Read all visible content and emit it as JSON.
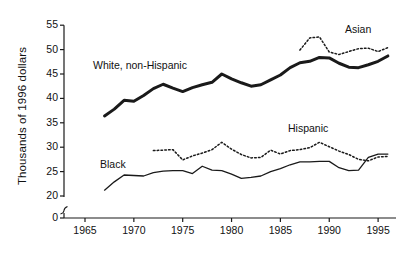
{
  "chart_data": {
    "type": "line",
    "title": "",
    "xlabel": "",
    "ylabel": "Thousands of 1996 dollars",
    "xlim": [
      1965,
      1996
    ],
    "ylim": [
      0,
      55
    ],
    "y_axis_break": true,
    "y_axis_break_between": [
      0,
      20
    ],
    "grid": false,
    "legend_position": "inline-annotations",
    "x_ticks": [
      "1965",
      "1970",
      "1975",
      "1980",
      "1985",
      "1990",
      "1995"
    ],
    "x_tick_values": [
      1965,
      1970,
      1975,
      1980,
      1985,
      1990,
      1995
    ],
    "y_ticks": [
      "0",
      "20",
      "25",
      "30",
      "35",
      "40",
      "45",
      "50",
      "55"
    ],
    "y_tick_values": [
      0,
      20,
      25,
      30,
      35,
      40,
      45,
      50,
      55
    ],
    "series": [
      {
        "name": "White, non-Hispanic",
        "style": "solid-thick",
        "color": "#1a1a1a",
        "x": [
          1967,
          1968,
          1969,
          1970,
          1971,
          1972,
          1973,
          1974,
          1975,
          1976,
          1977,
          1978,
          1979,
          1980,
          1981,
          1982,
          1983,
          1984,
          1985,
          1986,
          1987,
          1988,
          1989,
          1990,
          1991,
          1992,
          1993,
          1994,
          1995,
          1996
        ],
        "values": [
          36.4,
          37.8,
          39.6,
          39.4,
          40.6,
          42.0,
          42.9,
          42.1,
          41.4,
          42.2,
          42.8,
          43.3,
          45.0,
          44.0,
          43.2,
          42.5,
          42.8,
          43.8,
          44.8,
          46.3,
          47.3,
          47.6,
          48.4,
          48.3,
          47.2,
          46.4,
          46.3,
          46.9,
          47.6,
          48.7
        ]
      },
      {
        "name": "Asian",
        "style": "dotted",
        "color": "#1a1a1a",
        "x": [
          1987,
          1988,
          1989,
          1990,
          1991,
          1992,
          1993,
          1994,
          1995,
          1996
        ],
        "values": [
          49.9,
          52.4,
          52.6,
          49.5,
          49.0,
          49.6,
          50.2,
          50.3,
          49.6,
          50.4
        ]
      },
      {
        "name": "Hispanic",
        "style": "dotted",
        "color": "#1a1a1a",
        "x": [
          1972,
          1973,
          1974,
          1975,
          1976,
          1977,
          1978,
          1979,
          1980,
          1981,
          1982,
          1983,
          1984,
          1985,
          1986,
          1987,
          1988,
          1989,
          1990,
          1991,
          1992,
          1993,
          1994,
          1995,
          1996
        ],
        "values": [
          29.3,
          29.4,
          29.5,
          27.4,
          28.2,
          28.8,
          29.5,
          31.0,
          29.6,
          28.5,
          27.8,
          27.9,
          29.4,
          28.6,
          29.3,
          29.5,
          29.9,
          31.0,
          30.1,
          29.2,
          28.5,
          27.5,
          27.2,
          28.0,
          28.1
        ]
      },
      {
        "name": "Black",
        "style": "solid-thin",
        "color": "#1a1a1a",
        "x": [
          1967,
          1968,
          1969,
          1970,
          1971,
          1972,
          1973,
          1974,
          1975,
          1976,
          1977,
          1978,
          1979,
          1980,
          1981,
          1982,
          1983,
          1984,
          1985,
          1986,
          1987,
          1988,
          1989,
          1990,
          1991,
          1992,
          1993,
          1994,
          1995,
          1996
        ],
        "values": [
          21.2,
          22.9,
          24.3,
          24.2,
          24.1,
          24.8,
          25.1,
          25.2,
          25.2,
          24.6,
          26.1,
          25.3,
          25.2,
          24.5,
          23.6,
          23.8,
          24.1,
          25.0,
          25.6,
          26.4,
          27.0,
          27.0,
          27.1,
          27.1,
          25.8,
          25.2,
          25.3,
          27.9,
          28.6,
          28.6
        ]
      }
    ],
    "annotations": [
      {
        "text": "White, non-Hispanic",
        "series": "White, non-Hispanic"
      },
      {
        "text": "Asian",
        "series": "Asian"
      },
      {
        "text": "Hispanic",
        "series": "Hispanic"
      },
      {
        "text": "Black",
        "series": "Black"
      }
    ]
  }
}
